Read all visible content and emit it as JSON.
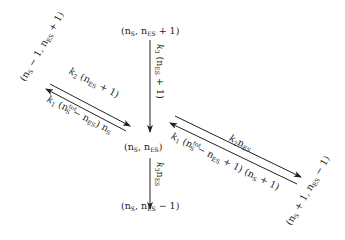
{
  "diagram": {
    "type": "state-transition",
    "states": {
      "center": {
        "pre": "(n",
        "s1": "S",
        "mid": ", n",
        "s2": "ES",
        "post": ")"
      },
      "top": {
        "pre": "(n",
        "s1": "S",
        "mid": ", n",
        "s2": "ES",
        "post": " + 1)"
      },
      "bottom": {
        "pre": "(n",
        "s1": "S",
        "mid": ", n",
        "s2": "ES",
        "post": " − 1)"
      },
      "upper_left": {
        "pre": "(n",
        "s1": "S",
        "mid": " − 1, n",
        "s2": "ES",
        "post": " + 1)"
      },
      "lower_right": {
        "pre": "(n",
        "s1": "S",
        "mid": " + 1, n",
        "s2": "ES",
        "post": " − 1)"
      }
    },
    "rates": {
      "top_to_center": {
        "k": "k",
        "ksub": "3",
        "a": " (n",
        "asub": "ES",
        "b": " + 1)"
      },
      "center_to_bottom": {
        "k": "k",
        "ksub": "3",
        "a": "n",
        "asub": "ES"
      },
      "center_to_upper_left": {
        "k": "k",
        "ksub": "2",
        "a": " (n",
        "asub": "ES",
        "b": " + 1)"
      },
      "upper_left_to_center": {
        "k": "k",
        "ksub": "1",
        "a": " (n",
        "asup": "tot",
        "asub": "S",
        "b": " − n",
        "bsub": "ES",
        "c": ") n",
        "csub": "S"
      },
      "center_to_lower_right": {
        "k": "k",
        "ksub": "2",
        "a": "n",
        "asub": "ES"
      },
      "lower_right_to_center": {
        "k": "k",
        "ksub": "1",
        "a": " (n",
        "asup": "tot",
        "asub": "S",
        "b": " − n",
        "bsub": "ES",
        "c": " + 1) (n",
        "csub": "S",
        "d": " + 1)"
      }
    }
  }
}
